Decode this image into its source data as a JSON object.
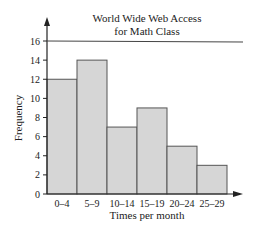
{
  "chart_data": {
    "type": "bar",
    "title": "World Wide Web Access",
    "subtitle": "for Math Class",
    "xlabel": "Times per month",
    "ylabel": "Frequency",
    "categories": [
      "0–4",
      "5–9",
      "10–14",
      "15–19",
      "20–24",
      "25–29"
    ],
    "values": [
      12,
      14,
      7,
      9,
      5,
      3
    ],
    "yticks": [
      0,
      2,
      4,
      6,
      8,
      10,
      12,
      14,
      16
    ],
    "ylim": [
      0,
      16
    ],
    "grid": false,
    "reference_line": 16,
    "legend": null,
    "colors": {
      "bar_fill": "#d6d6d6",
      "bar_stroke": "#555555",
      "axis": "#222222"
    }
  }
}
